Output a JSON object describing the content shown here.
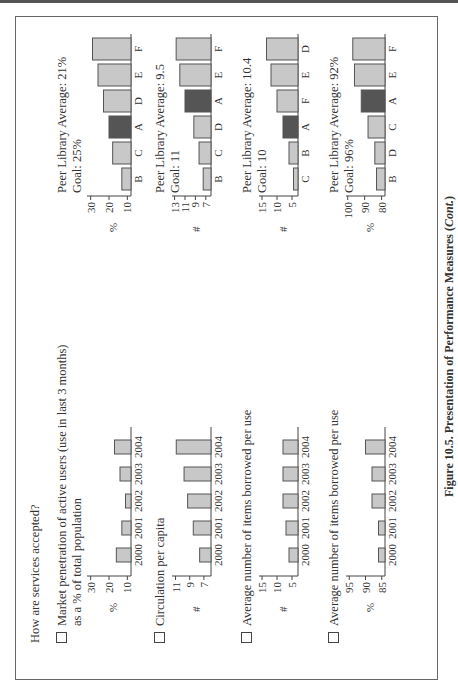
{
  "page": {
    "question": "How are services accepted?",
    "caption_main": "Figure 10.5. Presentation of Performance Measures (",
    "caption_italic": "Cont.",
    "caption_end": ")"
  },
  "measures": [
    {
      "label_line1": "Market penetration of active users (use in last 3 months)",
      "label_line2": "as a % of total population",
      "peer_average": "Peer Library Average: 21%",
      "goal": "Goal: 25%"
    },
    {
      "label_line1": "Circulation per capita",
      "label_line2": "",
      "peer_average": "Peer Library Average: 9.5",
      "goal": "Goal: 11"
    },
    {
      "label_line1": "Average number of items borrowed per use",
      "label_line2": "",
      "peer_average": "Peer Library Average: 10.4",
      "goal": "Goal: 10"
    },
    {
      "label_line1": "Average number of items borrowed per use",
      "label_line2": "",
      "peer_average": "Peer Library Average: 92%",
      "goal": "Goal: 96%"
    }
  ],
  "colors": {
    "bar_fill": "#c8c8c8",
    "highlight_fill": "#555555",
    "stroke": "#555555"
  },
  "chart_data": [
    {
      "type": "bar",
      "title": "Market penetration of active users - trend",
      "ylabel": "%",
      "categories": [
        "2000",
        "2001",
        "2002",
        "2003",
        "2004"
      ],
      "values": [
        16,
        13,
        11,
        14,
        17
      ],
      "ylim": [
        8,
        32
      ],
      "yticks": [
        10,
        20,
        30
      ],
      "highlight": []
    },
    {
      "type": "bar",
      "title": "Market penetration of active users - peers",
      "ylabel": "%",
      "categories": [
        "B",
        "C",
        "A",
        "D",
        "E",
        "F"
      ],
      "values": [
        13,
        18,
        20,
        23,
        26,
        29
      ],
      "ylim": [
        8,
        32
      ],
      "yticks": [
        10,
        20,
        30
      ],
      "highlight": [
        "A"
      ]
    },
    {
      "type": "bar",
      "title": "Circulation per capita - trend",
      "ylabel": "#",
      "categories": [
        "2000",
        "2001",
        "2002",
        "2003",
        "2004"
      ],
      "values": [
        7.6,
        8.5,
        9.3,
        9.8,
        10.9
      ],
      "ylim": [
        6,
        11.5
      ],
      "yticks": [
        7,
        9,
        11
      ],
      "highlight": []
    },
    {
      "type": "bar",
      "title": "Circulation per capita - peers",
      "ylabel": "#",
      "categories": [
        "B",
        "C",
        "D",
        "A",
        "E",
        "F"
      ],
      "values": [
        7.5,
        8.3,
        9.3,
        11,
        12,
        12.7
      ],
      "ylim": [
        6,
        13.5
      ],
      "yticks": [
        7,
        9,
        11,
        13
      ],
      "highlight": [
        "A"
      ]
    },
    {
      "type": "bar",
      "title": "Average number of items borrowed per use - trend",
      "ylabel": "#",
      "categories": [
        "2000",
        "2001",
        "2002",
        "2003",
        "2004"
      ],
      "values": [
        6,
        7,
        8,
        8,
        8
      ],
      "ylim": [
        3,
        16
      ],
      "yticks": [
        5,
        10,
        15
      ],
      "highlight": []
    },
    {
      "type": "bar",
      "title": "Average number of items borrowed per use - peers",
      "ylabel": "#",
      "categories": [
        "C",
        "B",
        "A",
        "F",
        "E",
        "D"
      ],
      "values": [
        4.5,
        6,
        8,
        10,
        12,
        13.5
      ],
      "ylim": [
        3,
        16
      ],
      "yticks": [
        5,
        10,
        15
      ],
      "highlight": [
        "A"
      ]
    },
    {
      "type": "bar",
      "title": "Average number of items borrowed per use (%) - trend",
      "ylabel": "%",
      "categories": [
        "2000",
        "2001",
        "2002",
        "2003",
        "2004"
      ],
      "values": [
        86,
        86,
        88,
        88,
        90
      ],
      "ylim": [
        84,
        96
      ],
      "yticks": [
        85,
        90,
        95
      ],
      "highlight": []
    },
    {
      "type": "bar",
      "title": "Average number of items borrowed per use (%) - peers",
      "ylabel": "%",
      "categories": [
        "B",
        "D",
        "C",
        "A",
        "E",
        "F"
      ],
      "values": [
        83,
        84,
        88,
        92,
        96,
        97
      ],
      "ylim": [
        78,
        101
      ],
      "yticks": [
        80,
        90,
        100
      ],
      "highlight": [
        "A"
      ]
    }
  ]
}
